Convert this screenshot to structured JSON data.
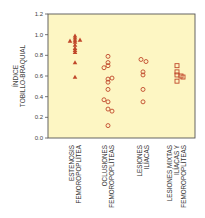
{
  "chart_data": {
    "type": "scatter",
    "title": "",
    "xlabel": "",
    "ylabel": [
      "ÍNDICE",
      "TOBILLO-BRAQUIAL"
    ],
    "ylim": [
      0.0,
      1.2
    ],
    "yticks": [
      "0.0",
      "0.2",
      "0.4",
      "0.6",
      "0.8",
      "1.0",
      "1.2"
    ],
    "grid": false,
    "legend": "none",
    "background": "#fdf6c3",
    "marker_color": "#c0472a",
    "categories": [
      {
        "label": [
          "ESTENOSIS",
          "FEMOROPOPLÍTEA"
        ],
        "marker": "triangle",
        "points": [
          {
            "dx": 0,
            "y": 0.99
          },
          {
            "dx": 0,
            "y": 0.97
          },
          {
            "dx": -5,
            "y": 0.94
          },
          {
            "dx": 5,
            "y": 0.95
          },
          {
            "dx": 0,
            "y": 0.95
          },
          {
            "dx": 0,
            "y": 0.93
          },
          {
            "dx": 0,
            "y": 0.9
          },
          {
            "dx": 0,
            "y": 0.87
          },
          {
            "dx": 0,
            "y": 0.85
          },
          {
            "dx": 0,
            "y": 0.83
          },
          {
            "dx": 0,
            "y": 0.73
          },
          {
            "dx": 0,
            "y": 0.59
          }
        ]
      },
      {
        "label": [
          "OCLUSIONES",
          "FEMOROPOPLÍTEAS"
        ],
        "marker": "circle",
        "points": [
          {
            "dx": 0,
            "y": 0.79
          },
          {
            "dx": 0,
            "y": 0.73
          },
          {
            "dx": 0,
            "y": 0.7
          },
          {
            "dx": -4,
            "y": 0.68
          },
          {
            "dx": 0,
            "y": 0.57
          },
          {
            "dx": 4,
            "y": 0.58
          },
          {
            "dx": 0,
            "y": 0.54
          },
          {
            "dx": 0,
            "y": 0.47
          },
          {
            "dx": -4,
            "y": 0.37
          },
          {
            "dx": 0,
            "y": 0.35
          },
          {
            "dx": 0,
            "y": 0.28
          },
          {
            "dx": 4,
            "y": 0.26
          },
          {
            "dx": 0,
            "y": 0.12
          }
        ]
      },
      {
        "label": [
          "LESIONES",
          "ILÍACAS"
        ],
        "marker": "circle",
        "points": [
          {
            "dx": -2,
            "y": 0.76
          },
          {
            "dx": 3,
            "y": 0.74
          },
          {
            "dx": 0,
            "y": 0.64
          },
          {
            "dx": 0,
            "y": 0.61
          },
          {
            "dx": 0,
            "y": 0.47
          },
          {
            "dx": 0,
            "y": 0.35
          }
        ]
      },
      {
        "label": [
          "LESIONES MIXTAS",
          "ILÍACAS Y",
          "FEMOROPOPLÍTEAS"
        ],
        "marker": "square",
        "points": [
          {
            "dx": 0,
            "y": 0.7
          },
          {
            "dx": 0,
            "y": 0.64
          },
          {
            "dx": 0,
            "y": 0.61
          },
          {
            "dx": 4,
            "y": 0.6
          },
          {
            "dx": 6,
            "y": 0.59
          },
          {
            "dx": 0,
            "y": 0.55
          }
        ]
      }
    ]
  }
}
